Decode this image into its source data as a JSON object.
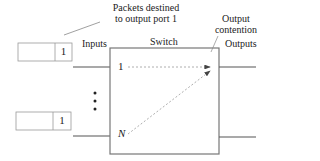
{
  "diagram": {
    "annotation_packets": [
      "Packets destined",
      "to output port 1"
    ],
    "annotation_contention": [
      "Output",
      "contention"
    ],
    "label_inputs": "Inputs",
    "label_switch": "Switch",
    "label_outputs": "Outputs",
    "input_port_top": "1",
    "input_port_bottom": "N",
    "queue_top_packet": "1",
    "queue_bottom_packet": "1",
    "ellipsis": "⋮",
    "colors": {
      "line": "#555555",
      "dashed": "#999999",
      "box": "#888888"
    }
  }
}
